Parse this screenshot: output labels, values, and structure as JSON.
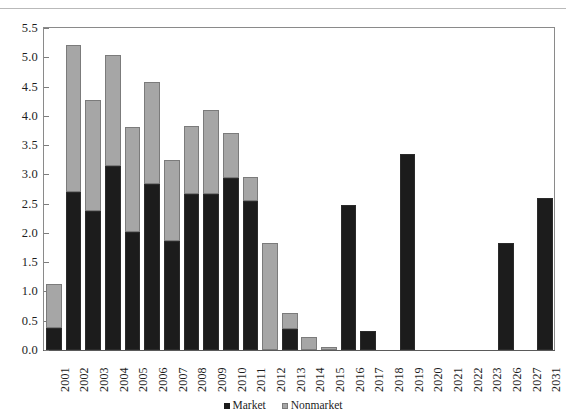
{
  "chart_data": {
    "type": "bar",
    "subtype": "stacked-vertical",
    "title": "",
    "subtitle": "",
    "xlabel": "",
    "ylabel": "",
    "ylim": [
      0.0,
      5.5
    ],
    "yticks": [
      "0.0",
      "0.5",
      "1.0",
      "1.5",
      "2.0",
      "2.5",
      "3.0",
      "3.5",
      "4.0",
      "4.5",
      "5.0",
      "5.5"
    ],
    "ytick_values": [
      0.0,
      0.5,
      1.0,
      1.5,
      2.0,
      2.5,
      3.0,
      3.5,
      4.0,
      4.5,
      5.0,
      5.5
    ],
    "grid": false,
    "legend_position": "bottom-center",
    "categories": [
      "2001",
      "2002",
      "2003",
      "2004",
      "2005",
      "2006",
      "2007",
      "2008",
      "2009",
      "2010",
      "2011",
      "2012",
      "2013",
      "2014",
      "2015",
      "2016",
      "2017",
      "2018",
      "2019",
      "2020",
      "2021",
      "2022",
      "2023",
      "2026",
      "2027",
      "2031"
    ],
    "series": [
      {
        "name": "Market",
        "color": "#1c1c1c",
        "values": [
          0.38,
          2.7,
          2.38,
          3.14,
          2.02,
          2.84,
          1.87,
          2.66,
          2.67,
          2.94,
          2.54,
          0.0,
          0.36,
          0.0,
          0.0,
          2.47,
          0.32,
          0.0,
          3.35,
          0.0,
          0.0,
          0.0,
          0.0,
          1.82,
          0.0,
          2.59
        ]
      },
      {
        "name": "Nonmarket",
        "color": "#a6a6a6",
        "values": [
          0.74,
          2.51,
          1.89,
          1.9,
          1.79,
          1.74,
          1.37,
          1.16,
          1.43,
          0.76,
          0.41,
          1.83,
          0.27,
          0.22,
          0.06,
          0.0,
          0.0,
          0.0,
          0.0,
          0.0,
          0.0,
          0.0,
          0.0,
          0.0,
          0.0,
          0.0
        ]
      }
    ],
    "totals": [
      1.12,
      5.21,
      4.27,
      5.04,
      3.81,
      4.58,
      3.24,
      3.82,
      4.1,
      3.7,
      2.95,
      1.83,
      0.63,
      0.22,
      0.06,
      2.47,
      0.32,
      0.0,
      3.35,
      0.0,
      0.0,
      0.0,
      0.0,
      1.82,
      0.0,
      2.59
    ]
  },
  "legend": {
    "items": [
      {
        "label": "Market",
        "color": "#1c1c1c"
      },
      {
        "label": "Nonmarket",
        "color": "#a6a6a6"
      }
    ]
  },
  "colors": {
    "market": "#1c1c1c",
    "nonmarket": "#a6a6a6",
    "axis": "#8a8a8a",
    "text": "#1d1d1d",
    "background": "#ffffff"
  }
}
